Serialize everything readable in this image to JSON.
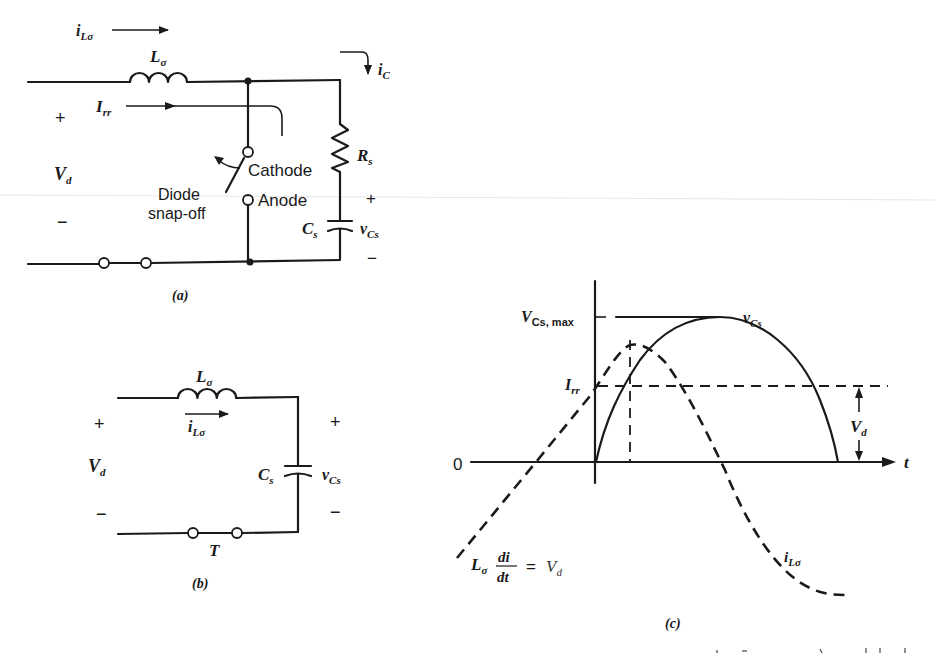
{
  "figure_a": {
    "caption": "(a)",
    "current_top": {
      "symbol": "i",
      "sub": "Lσ"
    },
    "inductor": {
      "symbol": "L",
      "sub": "σ"
    },
    "ic": {
      "symbol": "i",
      "sub": "C"
    },
    "irr": {
      "symbol": "I",
      "sub": "rr"
    },
    "plus": "+",
    "minus": "−",
    "vd": {
      "symbol": "V",
      "sub": "d"
    },
    "switch_label_1": "Diode",
    "switch_label_2": "snap-off",
    "cathode": "Cathode",
    "anode": "Anode",
    "resistor": {
      "symbol": "R",
      "sub": "s"
    },
    "capacitor": {
      "symbol": "C",
      "sub": "s"
    },
    "vcs": {
      "symbol": "v",
      "sub": "Cs"
    },
    "cap_plus": "+",
    "cap_minus": "−"
  },
  "figure_b": {
    "caption": "(b)",
    "inductor": {
      "symbol": "L",
      "sub": "σ"
    },
    "current": {
      "symbol": "i",
      "sub": "Lσ"
    },
    "plus": "+",
    "minus": "−",
    "vd": {
      "symbol": "V",
      "sub": "d"
    },
    "capacitor": {
      "symbol": "C",
      "sub": "s"
    },
    "vcs": {
      "symbol": "v",
      "sub": "Cs"
    },
    "cap_plus": "+",
    "cap_minus": "−",
    "switch": "T"
  },
  "figure_c": {
    "caption": "(c)",
    "origin": "0",
    "t_axis": "t",
    "vcs_max": {
      "symbol": "V",
      "sub": "Cs, max"
    },
    "irr": {
      "symbol": "I",
      "sub": "rr"
    },
    "vcs_curve": {
      "symbol": "v",
      "sub": "Cs"
    },
    "il_curve": {
      "symbol": "i",
      "sub": "Lσ"
    },
    "vd": {
      "symbol": "V",
      "sub": "d"
    },
    "equation": {
      "lhs": "L",
      "lhs_sub": "σ",
      "num": "di",
      "den": "dt",
      "eq": "=",
      "rhs": "V",
      "rhs_sub": "d"
    }
  }
}
